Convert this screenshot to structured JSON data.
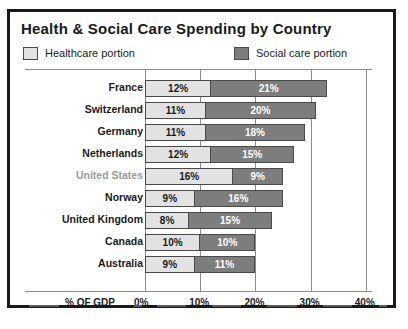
{
  "chart": {
    "title": "Health & Social Care Spending by Country",
    "legend": [
      {
        "label": "Healthcare portion",
        "color": "#e2e2e2",
        "key": "healthcare"
      },
      {
        "label": "Social care portion",
        "color": "#7d7d7d",
        "key": "social"
      }
    ],
    "axis_label": "% OF GDP",
    "tick_labels": [
      "0%",
      "10%",
      "20%",
      "30%",
      "40%"
    ]
  },
  "chart_data": {
    "type": "bar",
    "orientation": "horizontal",
    "stacked": true,
    "title": "Health & Social Care Spending by Country",
    "xlabel": "% OF GDP",
    "ylabel": "",
    "xlim": [
      0,
      40
    ],
    "xticks": [
      0,
      10,
      20,
      30,
      40
    ],
    "xtick_labels": [
      "0%",
      "10%",
      "20%",
      "30%",
      "40%"
    ],
    "grid": true,
    "legend_position": "top-left",
    "categories": [
      "France",
      "Switzerland",
      "Germany",
      "Netherlands",
      "United States",
      "Norway",
      "United Kingdom",
      "Canada",
      "Australia"
    ],
    "series": [
      {
        "name": "Healthcare portion",
        "color": "#e2e2e2",
        "values": [
          12,
          11,
          11,
          12,
          16,
          9,
          8,
          10,
          9
        ],
        "labels": [
          "12%",
          "11%",
          "11%",
          "12%",
          "16%",
          "9%",
          "8%",
          "10%",
          "9%"
        ]
      },
      {
        "name": "Social care portion",
        "color": "#7d7d7d",
        "values": [
          21,
          20,
          18,
          15,
          9,
          16,
          15,
          10,
          11
        ],
        "labels": [
          "21%",
          "20%",
          "18%",
          "15%",
          "9%",
          "16%",
          "15%",
          "10%",
          "11%"
        ]
      }
    ],
    "totals": [
      33,
      31,
      29,
      27,
      25,
      25,
      23,
      20,
      20
    ],
    "highlighted_category": "United States"
  }
}
